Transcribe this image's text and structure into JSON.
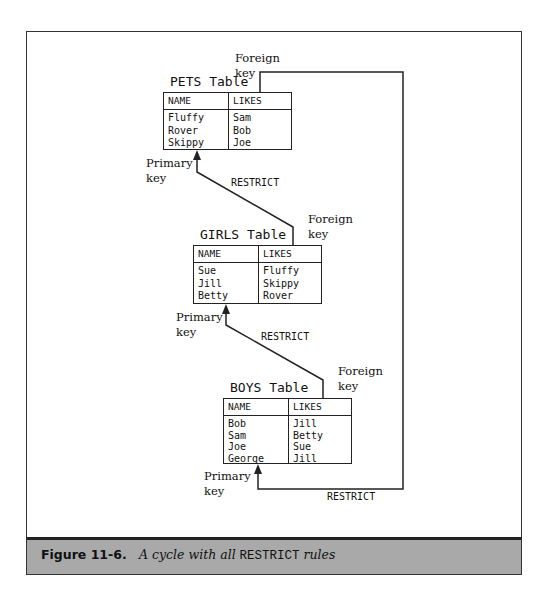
{
  "figure": {
    "label": "Figure 11-6.",
    "caption_prefix": "A cycle with all ",
    "caption_code": "RESTRICT",
    "caption_suffix": " rules"
  },
  "tables": [
    {
      "title": "PETS Table",
      "columns": [
        "NAME",
        "LIKES"
      ],
      "rows": [
        [
          "Fluffy",
          "Sam"
        ],
        [
          "Rover",
          "Bob"
        ],
        [
          "Skippy",
          "Joe"
        ]
      ]
    },
    {
      "title": "GIRLS Table",
      "columns": [
        "NAME",
        "LIKES"
      ],
      "rows": [
        [
          "Sue",
          "Fluffy"
        ],
        [
          "Jill",
          "Skippy"
        ],
        [
          "Betty",
          "Rover"
        ]
      ]
    },
    {
      "title": "BOYS Table",
      "columns": [
        "NAME",
        "LIKES"
      ],
      "rows": [
        [
          "Bob",
          "Jill"
        ],
        [
          "Sam",
          "Betty"
        ],
        [
          "Joe",
          "Sue"
        ],
        [
          "George",
          "Jill"
        ]
      ]
    }
  ],
  "labels": {
    "foreign_key_line1": "Foreign",
    "foreign_key_line2": "key",
    "primary_key_line1": "Primary",
    "primary_key_line2": "key",
    "restrict": "RESTRICT"
  },
  "colors": {
    "line": "#222222",
    "caption_bg": "#a9a9a9"
  }
}
